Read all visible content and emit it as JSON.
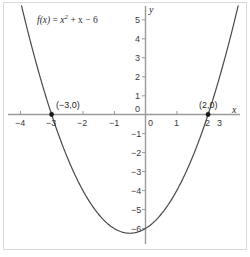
{
  "chart_data": {
    "type": "line",
    "title": "",
    "function_label": "f(x) = x² + x − 6",
    "function_label_parts": {
      "fname": "f",
      "arg": "(x)",
      "equals": " = ",
      "var1": "x",
      "exp": "2",
      "rest": " + x − 6"
    },
    "expression": "x^2 + x - 6",
    "xlabel": "x",
    "ylabel": "y",
    "xlim": [
      -4.45,
      3.55
    ],
    "ylim": [
      -6.55,
      5.6
    ],
    "grid": false,
    "legend": null,
    "xticks": [
      -4,
      -3,
      -2,
      -1,
      0,
      1,
      2,
      3
    ],
    "xtick_labels": [
      "−4",
      "−3",
      "−2",
      "−1",
      "0",
      "1",
      "2",
      "3"
    ],
    "yticks": [
      -6,
      -5,
      -4,
      -3,
      -2,
      -1,
      0,
      1,
      2,
      3,
      4,
      5
    ],
    "ytick_labels": [
      "−6",
      "−5",
      "−4",
      "−3",
      "−2",
      "−1",
      "0",
      "1",
      "2",
      "3",
      "4",
      "5"
    ],
    "vertex": [
      -0.5,
      -6.25
    ],
    "roots": [
      -3,
      2
    ],
    "points": [
      {
        "name": "left-root",
        "x": -3,
        "y": 0,
        "label": "(−3,0)"
      },
      {
        "name": "right-root",
        "x": 2,
        "y": 0,
        "label": "(2,0)"
      }
    ],
    "series": [
      {
        "name": "f(x) = x^2 + x - 6",
        "x": [
          -3.6,
          -3.4,
          -3.2,
          -3.0,
          -2.8,
          -2.6,
          -2.4,
          -2.2,
          -2.0,
          -1.8,
          -1.6,
          -1.4,
          -1.2,
          -1.0,
          -0.8,
          -0.6,
          -0.5,
          -0.4,
          -0.2,
          0.0,
          0.2,
          0.4,
          0.6,
          0.8,
          1.0,
          1.2,
          1.4,
          1.6,
          1.8,
          2.0,
          2.2,
          2.4,
          2.6
        ],
        "values": [
          3.36,
          2.16,
          1.04,
          0.0,
          -0.96,
          -1.84,
          -2.64,
          -3.36,
          -4.0,
          -4.56,
          -5.04,
          -5.44,
          -5.76,
          -6.0,
          -6.16,
          -6.24,
          -6.25,
          -6.24,
          -6.16,
          -6.0,
          -5.76,
          -5.44,
          -5.04,
          -4.56,
          -4.0,
          -3.36,
          -2.64,
          -1.84,
          -0.96,
          0.0,
          1.04,
          2.16,
          3.36
        ]
      }
    ],
    "colors": {
      "curve": "#4a4a4a",
      "axis": "#9a9a9a",
      "text": "#2a2a2a",
      "border": "#d8d8d8",
      "point": "#1a1a1a",
      "background": "#ffffff"
    }
  }
}
